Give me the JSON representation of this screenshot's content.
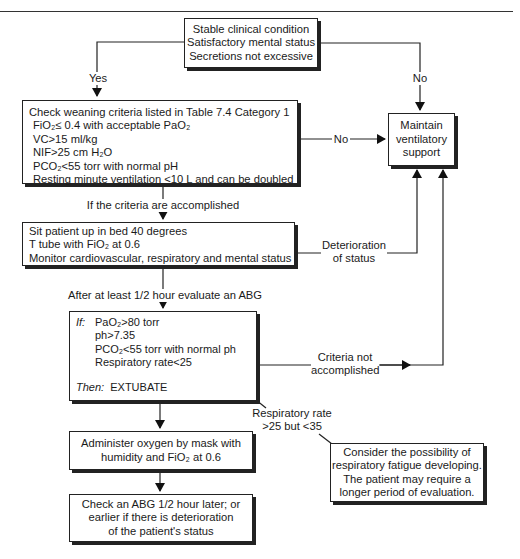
{
  "header": {
    "rule": true
  },
  "nodes": {
    "start": {
      "lines": [
        "Stable clinical condition",
        "Satisfactory mental status",
        "Secretions not excessive"
      ]
    },
    "criteria": {
      "title": "Check weaning criteria listed in Table 7.4 Category 1",
      "items": [
        "FiO₂≤ 0.4 with acceptable PaO₂",
        "VC>15 ml/kg",
        "NIF>25 cm H₂O",
        "PCO₂<55 torr with normal pH",
        "Resting minute ventilation <10 L and can be doubled"
      ]
    },
    "maintain": {
      "lines": [
        "Maintain",
        "ventilatory",
        "support"
      ]
    },
    "sit_up": {
      "lines": [
        "Sit patient up in bed 40 degrees",
        "T tube with FiO₂ at 0.6",
        "Monitor cardiovascular, respiratory and mental status"
      ]
    },
    "evaluate": {
      "if_label": "If:",
      "conditions": [
        "PaO₂>80 torr",
        "ph>7.35",
        "PCO₂<55 torr with normal ph",
        "Respiratory rate<25"
      ],
      "then_label": "Then:",
      "then_action": "EXTUBATE"
    },
    "oxygen": {
      "lines": [
        "Administer oxygen by mask with",
        "humidity and FiO₂ at 0.6"
      ]
    },
    "recheck": {
      "lines": [
        "Check an ABG 1/2 hour later; or",
        "earlier if there is deterioration",
        "of the patient's status"
      ]
    },
    "fatigue_note": {
      "lines": [
        "Consider the possibility of",
        "respiratory fatigue developing.",
        "The patient may require a",
        "longer period of evaluation."
      ]
    }
  },
  "edges": {
    "yes": "Yes",
    "no_top": "No",
    "no_criteria": "No",
    "criteria_accomplished": "If the criteria are accomplished",
    "deterioration": [
      "Deterioration",
      "of status"
    ],
    "after_half_hour": "After at least 1/2 hour evaluate an ABG",
    "criteria_not_accomplished": [
      "Criteria not",
      "accomplished"
    ],
    "resp_rate": [
      "Respiratory rate",
      ">25 but <35"
    ]
  }
}
